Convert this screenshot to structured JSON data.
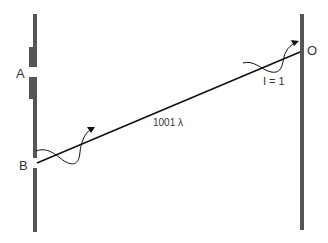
{
  "diagram": {
    "labels": {
      "A": "A",
      "B": "B",
      "O": "O",
      "distance": "1001 λ",
      "intensity": "I = 1"
    },
    "colors": {
      "wall": "#555555",
      "line": "#111111",
      "text": "#333333"
    }
  }
}
